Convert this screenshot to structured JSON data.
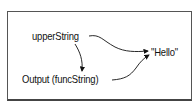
{
  "diagram": {
    "nodes": [
      {
        "id": "upperString",
        "label": "upperString"
      },
      {
        "id": "output",
        "label": "Output (funcString)"
      },
      {
        "id": "hello",
        "label": "\"Hello\""
      }
    ],
    "edges": [
      {
        "from": "upperString",
        "to": "hello"
      },
      {
        "from": "upperString",
        "to": "output"
      },
      {
        "from": "output",
        "to": "hello"
      }
    ]
  }
}
